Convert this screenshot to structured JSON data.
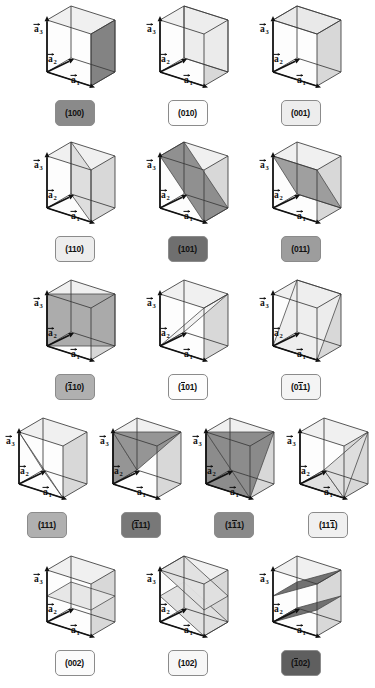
{
  "figure": {
    "background": "#ffffff",
    "axis_labels": {
      "a1": "a",
      "a2": "a",
      "a3": "a",
      "sub1": "1",
      "sub2": "2",
      "sub3": "3"
    },
    "palette": {
      "cube_edge": "#3a3a3a",
      "axis_arrow": "#111111",
      "face_top": "#f0f0f0",
      "face_right": "#d8d8d8",
      "plane_light": "#e4e4e4",
      "plane_mid": "#b4b4b4",
      "plane_dark": "#7e7e7e",
      "badge_white": "#fdfdfd",
      "badge_vlight": "#ededed",
      "badge_light": "#dcdcdc",
      "badge_mid": "#b0b0b0",
      "badge_dark": "#8a8a8a",
      "badge_darker": "#6f6f6f"
    }
  },
  "rows": [
    {
      "id": "row-1",
      "top": 2,
      "cells": [
        {
          "id": "cell-100",
          "label": "(100)",
          "bars": [],
          "badge_color": "#8a8a8a",
          "plane": "x1",
          "plane_shade": "#7e7e7e"
        },
        {
          "id": "cell-010",
          "label": "(010)",
          "bars": [],
          "badge_color": "#fdfdfd",
          "plane": "y1",
          "plane_shade": "#ececec"
        },
        {
          "id": "cell-001",
          "label": "(001)",
          "bars": [],
          "badge_color": "#ededed",
          "plane": "z1",
          "plane_shade": "#e8e8e8"
        }
      ]
    },
    {
      "id": "row-2",
      "top": 138,
      "cells": [
        {
          "id": "cell-110",
          "label": "(110)",
          "bars": [],
          "badge_color": "#ededed",
          "plane": "d110",
          "plane_shade": "#dcdcdc"
        },
        {
          "id": "cell-101",
          "label": "(101)",
          "bars": [],
          "badge_color": "#6f6f6f",
          "plane": "d101",
          "plane_shade": "#8a8a8a"
        },
        {
          "id": "cell-011",
          "label": "(011)",
          "bars": [],
          "badge_color": "#9d9d9d",
          "plane": "d011",
          "plane_shade": "#9a9a9a"
        }
      ]
    },
    {
      "id": "row-3",
      "top": 276,
      "cells": [
        {
          "id": "cell-bar110",
          "label": "(110)",
          "bars": [
            0
          ],
          "badge_color": "#b0b0b0",
          "plane": "db110",
          "plane_shade": "#a8a8a8"
        },
        {
          "id": "cell-bar101",
          "label": "(101)",
          "bars": [
            0
          ],
          "badge_color": "#fdfdfd",
          "plane": "db101",
          "plane_shade": "#f2f2f2"
        },
        {
          "id": "cell-0bar11",
          "label": "(011)",
          "bars": [
            1
          ],
          "badge_color": "#f4f4f4",
          "plane": "db011",
          "plane_shade": "#ededed"
        }
      ]
    },
    {
      "id": "row-4",
      "top": 414,
      "cells": [
        {
          "id": "cell-111",
          "label": "(111)",
          "bars": [],
          "badge_color": "#b0b0b0",
          "plane": "t111",
          "plane_shade": "#c8c8c8"
        },
        {
          "id": "cell-bar111",
          "label": "(111)",
          "bars": [
            0
          ],
          "badge_color": "#787878",
          "plane": "tb111",
          "plane_shade": "#8f8f8f"
        },
        {
          "id": "cell-1bar11",
          "label": "(111)",
          "bars": [
            1
          ],
          "badge_color": "#8a8a8a",
          "plane": "t1b11",
          "plane_shade": "#868686"
        },
        {
          "id": "cell-11bar1",
          "label": "(111)",
          "bars": [
            2
          ],
          "badge_color": "#f0f0f0",
          "plane": "t11b1",
          "plane_shade": "#dedede"
        }
      ]
    },
    {
      "id": "row-5",
      "top": 552,
      "cells": [
        {
          "id": "cell-002",
          "label": "(002)",
          "bars": [],
          "badge_color": "#fbfbfb",
          "plane": "p002",
          "plane_shade": "#e6e6e6"
        },
        {
          "id": "cell-102",
          "label": "(102)",
          "bars": [],
          "badge_color": "#f7f7f7",
          "plane": "p102",
          "plane_shade": "#e0e0e0"
        },
        {
          "id": "cell-bar102",
          "label": "(102)",
          "bars": [
            0
          ],
          "badge_color": "#5f5f5f",
          "plane": "pb102",
          "plane_shade": "#6a6a6a"
        }
      ]
    }
  ]
}
